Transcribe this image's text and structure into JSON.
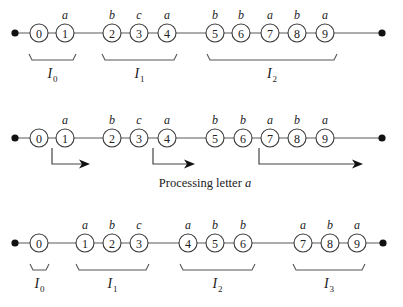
{
  "diagram": {
    "rows": [
      {
        "id": "row-1",
        "y": 33,
        "start_dot_x": 15,
        "end_dot_x": 382,
        "nodes": [
          {
            "label": "0",
            "letter": "",
            "x": 39
          },
          {
            "label": "1",
            "letter": "a",
            "x": 65
          },
          {
            "label": "2",
            "letter": "b",
            "x": 112
          },
          {
            "label": "3",
            "letter": "c",
            "x": 139
          },
          {
            "label": "4",
            "letter": "a",
            "x": 167
          },
          {
            "label": "5",
            "letter": "b",
            "x": 215
          },
          {
            "label": "6",
            "letter": "b",
            "x": 241
          },
          {
            "label": "7",
            "letter": "a",
            "x": 270
          },
          {
            "label": "8",
            "letter": "b",
            "x": 297
          },
          {
            "label": "9",
            "letter": "a",
            "x": 325
          }
        ],
        "intervals": [
          {
            "name": "I",
            "sub": "0",
            "x1": 29,
            "x2": 76
          },
          {
            "name": "I",
            "sub": "1",
            "x1": 102,
            "x2": 177
          },
          {
            "name": "I",
            "sub": "2",
            "x1": 207,
            "x2": 337
          }
        ]
      },
      {
        "id": "row-2",
        "y": 138,
        "start_dot_x": 15,
        "end_dot_x": 382,
        "nodes": [
          {
            "label": "0",
            "letter": "",
            "x": 39
          },
          {
            "label": "1",
            "letter": "a",
            "x": 65
          },
          {
            "label": "2",
            "letter": "b",
            "x": 112
          },
          {
            "label": "3",
            "letter": "c",
            "x": 139
          },
          {
            "label": "4",
            "letter": "a",
            "x": 167
          },
          {
            "label": "5",
            "letter": "b",
            "x": 215
          },
          {
            "label": "6",
            "letter": "b",
            "x": 243
          },
          {
            "label": "7",
            "letter": "a",
            "x": 270
          },
          {
            "label": "8",
            "letter": "b",
            "x": 297
          },
          {
            "label": "9",
            "letter": "a",
            "x": 325
          }
        ],
        "arrows": [
          {
            "x_start": 52,
            "x_end": 90
          },
          {
            "x_start": 153,
            "x_end": 195
          },
          {
            "x_start": 259,
            "x_end": 363
          }
        ],
        "caption_prefix": "Processing letter ",
        "caption_letter": "a"
      },
      {
        "id": "row-3",
        "y": 243,
        "start_dot_x": 15,
        "end_dot_x": 383,
        "nodes": [
          {
            "label": "0",
            "letter": "",
            "x": 39
          },
          {
            "label": "1",
            "letter": "a",
            "x": 85
          },
          {
            "label": "2",
            "letter": "b",
            "x": 112
          },
          {
            "label": "3",
            "letter": "c",
            "x": 139
          },
          {
            "label": "4",
            "letter": "a",
            "x": 188
          },
          {
            "label": "5",
            "letter": "b",
            "x": 215
          },
          {
            "label": "6",
            "letter": "b",
            "x": 243
          },
          {
            "label": "7",
            "letter": "a",
            "x": 303
          },
          {
            "label": "8",
            "letter": "b",
            "x": 330
          },
          {
            "label": "9",
            "letter": "a",
            "x": 357
          }
        ],
        "intervals": [
          {
            "name": "I",
            "sub": "0",
            "x1": 30,
            "x2": 49
          },
          {
            "name": "I",
            "sub": "1",
            "x1": 76,
            "x2": 149
          },
          {
            "name": "I",
            "sub": "2",
            "x1": 180,
            "x2": 255
          },
          {
            "name": "I",
            "sub": "3",
            "x1": 293,
            "x2": 365
          }
        ]
      }
    ]
  }
}
